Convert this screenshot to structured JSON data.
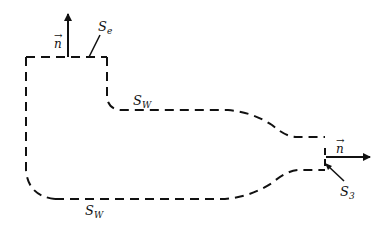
{
  "diagram": {
    "stroke_color": "#111111",
    "background": "#ffffff",
    "labels": {
      "n_top": "n",
      "n_right": "n",
      "se_main": "S",
      "se_sub": "e",
      "sw_top_main": "S",
      "sw_top_sub": "W",
      "sw_bottom_main": "S",
      "sw_bottom_sub": "W",
      "s3_main": "S",
      "s3_sub": "3"
    },
    "vector_symbol": "→"
  }
}
